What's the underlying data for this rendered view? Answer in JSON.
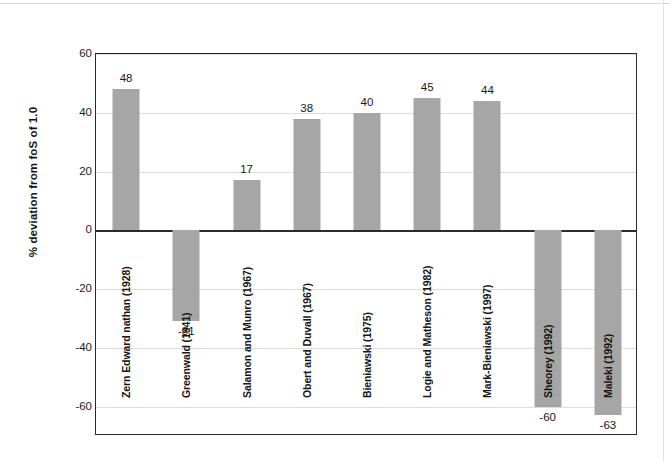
{
  "chart_data": {
    "type": "bar",
    "title": "",
    "subtitle": "",
    "xlabel": "",
    "ylabel": "% deviation from foS of 1.0",
    "ylim": [
      -70,
      60
    ],
    "yticks": [
      60,
      40,
      20,
      0,
      -20,
      -40,
      -60
    ],
    "ytick_labels": [
      "60",
      "40",
      "20",
      "0",
      "-20",
      "-40",
      "-60"
    ],
    "grid": true,
    "grid_axis": "y",
    "legend": "none",
    "bar_color": "#a6a6a6",
    "axis_color": "#2b2b2b",
    "gridline_color": "#dcdcdc",
    "categories": [
      "Zern Edward nathan (1928)",
      "Greenwald (1941)",
      "Salamon and Munro (1967)",
      "Obert and Duvall (1967)",
      "Bieniawski (1975)",
      "Logie and Matheson (1982)",
      "Mark-Bieniawski (1997)",
      "Sheorey (1992)",
      "Maleki (1992)"
    ],
    "values": [
      48,
      -31,
      17,
      38,
      40,
      45,
      44,
      -60,
      -63
    ],
    "value_labels": [
      "48",
      "-31",
      "17",
      "38",
      "40",
      "45",
      "44",
      "-60",
      "-63"
    ],
    "series": [
      {
        "name": "% deviation from foS of 1.0",
        "values": [
          48,
          -31,
          17,
          38,
          40,
          45,
          44,
          -60,
          -63
        ]
      }
    ]
  }
}
